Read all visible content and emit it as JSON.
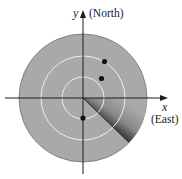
{
  "diagram": {
    "type": "radar-display",
    "center": {
      "x": 83,
      "y": 98
    },
    "outer_radius": 64,
    "ring_radii": [
      21,
      42
    ],
    "sweep_angle_deg": -44,
    "wedge_span_deg": 44,
    "colors": {
      "disc": "#a9a9a9",
      "disc_edge": "#6e6e6e",
      "rings": "#efefef",
      "axes": "#1c1c1c",
      "dots": "#111111",
      "wedge_dark": "#3a3a3a"
    },
    "axes": {
      "y_label": "y",
      "y_direction_label": "(North)",
      "x_label": "x",
      "x_direction_label": "(East)"
    },
    "targets": [
      {
        "x": 104.5,
        "y": 61.5
      },
      {
        "x": 101.5,
        "y": 78.5
      },
      {
        "x": 83,
        "y": 118
      }
    ]
  }
}
